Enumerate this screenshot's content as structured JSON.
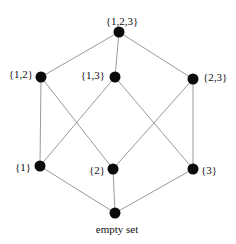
{
  "diagram": {
    "type": "Hasse diagram of power set of {1,2,3}",
    "nodes": [
      {
        "id": "n123",
        "label": "{1,2,3}",
        "x": 119,
        "y": 32,
        "lx": 122,
        "ly": 22,
        "anchor": "middle"
      },
      {
        "id": "n12",
        "label": "{1,2}",
        "x": 41,
        "y": 77,
        "lx": 33,
        "ly": 75,
        "anchor": "end"
      },
      {
        "id": "n13",
        "label": "{1,3}",
        "x": 115,
        "y": 77,
        "lx": 105,
        "ly": 76,
        "anchor": "end"
      },
      {
        "id": "n23",
        "label": "{2,3}",
        "x": 193,
        "y": 79,
        "lx": 203,
        "ly": 78,
        "anchor": "start"
      },
      {
        "id": "n1",
        "label": "{1}",
        "x": 40,
        "y": 166,
        "lx": 31,
        "ly": 168,
        "anchor": "end"
      },
      {
        "id": "n2",
        "label": "{2}",
        "x": 113,
        "y": 169,
        "lx": 105,
        "ly": 171,
        "anchor": "end"
      },
      {
        "id": "n3",
        "label": "{3}",
        "x": 193,
        "y": 169,
        "lx": 201,
        "ly": 171,
        "anchor": "start"
      },
      {
        "id": "n0",
        "label": "empty set",
        "x": 115,
        "y": 213,
        "lx": 117,
        "ly": 230,
        "anchor": "middle"
      }
    ],
    "edges": [
      [
        "n123",
        "n12"
      ],
      [
        "n123",
        "n13"
      ],
      [
        "n123",
        "n23"
      ],
      [
        "n12",
        "n1"
      ],
      [
        "n12",
        "n2"
      ],
      [
        "n13",
        "n1"
      ],
      [
        "n13",
        "n3"
      ],
      [
        "n23",
        "n2"
      ],
      [
        "n23",
        "n3"
      ],
      [
        "n1",
        "n0"
      ],
      [
        "n2",
        "n0"
      ],
      [
        "n3",
        "n0"
      ]
    ]
  }
}
